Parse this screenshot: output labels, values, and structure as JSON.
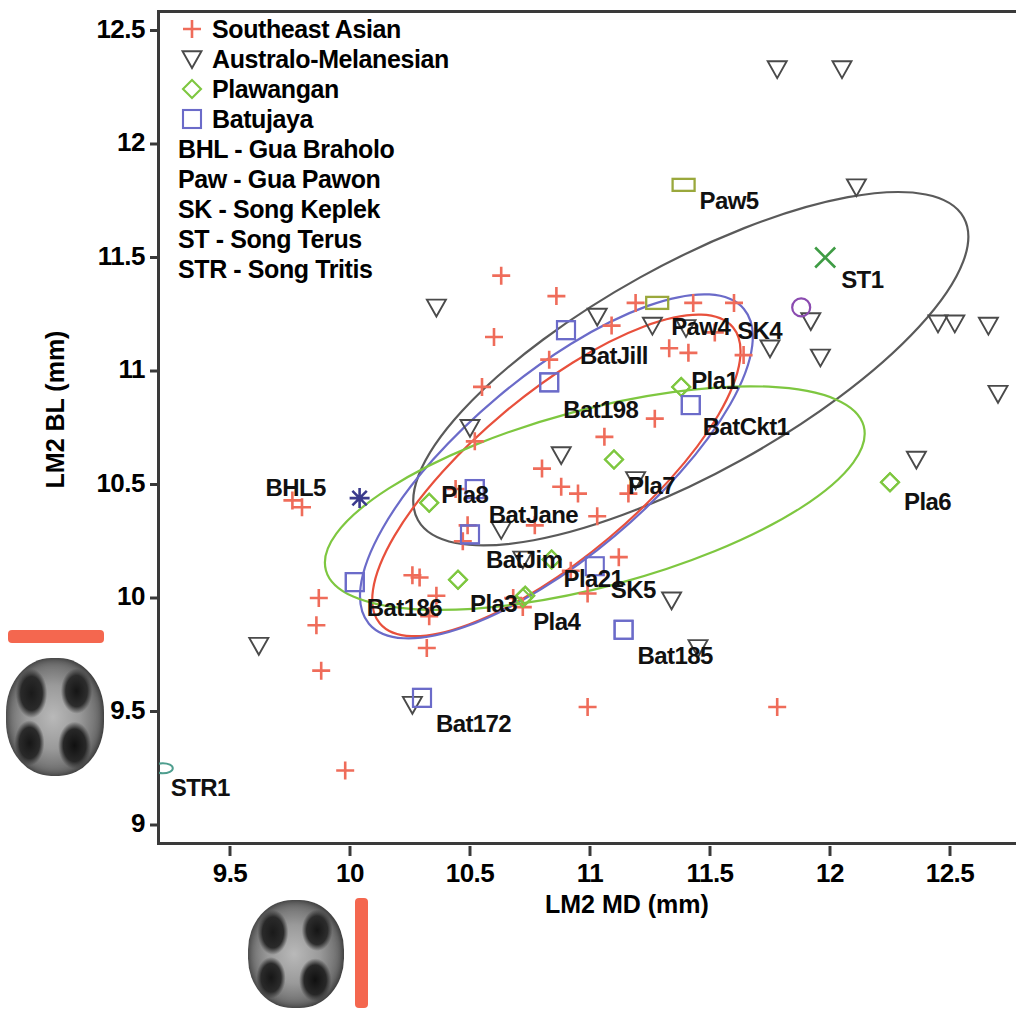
{
  "chart_data": {
    "type": "scatter",
    "title": "",
    "xlabel": "LM2 MD (mm)",
    "ylabel": "LM2  BL (mm)",
    "xlim": [
      9.2,
      12.8
    ],
    "ylim": [
      9.0,
      12.62
    ],
    "xticks": [
      "9.5",
      "10",
      "10.5",
      "11",
      "11.5",
      "12",
      "12.5"
    ],
    "xtick_values": [
      9.5,
      10,
      10.5,
      11,
      11.5,
      12,
      12.5
    ],
    "yticks": [
      "12.5",
      "12",
      "11.5",
      "11",
      "10.5",
      "10",
      "9.5",
      "9"
    ],
    "ytick_values": [
      12.5,
      12,
      11.5,
      11,
      10.5,
      10,
      9.5,
      9
    ],
    "grid": false,
    "legend_position": "top-left",
    "series": [
      {
        "name": "Southeast Asian",
        "marker": "plus",
        "color": "#ef6c5a",
        "points": [
          [
            9.76,
            10.43
          ],
          [
            9.8,
            10.4
          ],
          [
            9.87,
            10.0
          ],
          [
            9.86,
            9.88
          ],
          [
            9.88,
            9.68
          ],
          [
            10.26,
            10.1
          ],
          [
            10.29,
            10.09
          ],
          [
            10.33,
            9.92
          ],
          [
            10.36,
            10.01
          ],
          [
            10.32,
            9.78
          ],
          [
            10.44,
            10.48
          ],
          [
            10.47,
            10.25
          ],
          [
            10.49,
            10.32
          ],
          [
            10.52,
            10.69
          ],
          [
            10.55,
            10.93
          ],
          [
            10.6,
            11.15
          ],
          [
            10.63,
            11.42
          ],
          [
            10.68,
            10.0
          ],
          [
            10.72,
            9.96
          ],
          [
            10.77,
            10.32
          ],
          [
            10.8,
            10.57
          ],
          [
            10.83,
            11.05
          ],
          [
            10.86,
            11.33
          ],
          [
            10.88,
            10.49
          ],
          [
            10.92,
            10.12
          ],
          [
            10.95,
            10.46
          ],
          [
            10.99,
            10.02
          ],
          [
            11.03,
            10.36
          ],
          [
            11.06,
            10.71
          ],
          [
            11.09,
            11.2
          ],
          [
            11.12,
            10.18
          ],
          [
            11.16,
            10.46
          ],
          [
            11.19,
            11.3
          ],
          [
            11.27,
            10.79
          ],
          [
            11.33,
            11.1
          ],
          [
            11.41,
            11.08
          ],
          [
            11.43,
            11.3
          ],
          [
            11.52,
            11.17
          ],
          [
            11.6,
            11.3
          ],
          [
            11.64,
            11.07
          ],
          [
            10.99,
            9.52
          ],
          [
            11.78,
            9.52
          ],
          [
            9.98,
            9.24
          ]
        ]
      },
      {
        "name": "Australo-Melanesian",
        "marker": "triangle-down",
        "color": "#4a4a4a",
        "points": [
          [
            11.78,
            12.33
          ],
          [
            12.05,
            12.33
          ],
          [
            12.11,
            11.81
          ],
          [
            12.45,
            11.21
          ],
          [
            12.52,
            11.21
          ],
          [
            12.66,
            11.2
          ],
          [
            12.7,
            10.9
          ],
          [
            11.92,
            11.22
          ],
          [
            11.75,
            11.1
          ],
          [
            11.96,
            11.06
          ],
          [
            12.36,
            10.61
          ],
          [
            10.36,
            11.28
          ],
          [
            10.5,
            10.75
          ],
          [
            10.88,
            10.63
          ],
          [
            11.26,
            11.2
          ],
          [
            11.4,
            11.19
          ],
          [
            10.63,
            10.3
          ],
          [
            10.72,
            10.17
          ],
          [
            11.34,
            9.99
          ],
          [
            11.45,
            9.78
          ],
          [
            10.26,
            9.53
          ],
          [
            9.62,
            9.79
          ],
          [
            11.03,
            11.24
          ],
          [
            11.19,
            10.52
          ]
        ]
      },
      {
        "name": "Plawangan",
        "marker": "diamond",
        "color": "#7ec740",
        "points": [
          [
            10.33,
            10.42
          ],
          [
            10.45,
            10.08
          ],
          [
            10.73,
            10.01
          ],
          [
            10.84,
            10.17
          ],
          [
            11.1,
            10.61
          ],
          [
            11.38,
            10.93
          ],
          [
            12.25,
            10.51
          ],
          [
            10.72,
            10.0
          ]
        ]
      },
      {
        "name": "Batujaya",
        "marker": "square",
        "color": "#6b6bc9",
        "points": [
          [
            10.9,
            11.18
          ],
          [
            10.83,
            10.95
          ],
          [
            11.42,
            10.85
          ],
          [
            10.52,
            10.48
          ],
          [
            10.5,
            10.28
          ],
          [
            10.02,
            10.07
          ],
          [
            11.14,
            9.86
          ],
          [
            10.3,
            9.56
          ]
        ]
      }
    ],
    "labeled_specimens": [
      {
        "label": "Paw5",
        "x": 11.39,
        "y": 11.82,
        "marker": "rect",
        "color": "#9aa83c",
        "lx": 16,
        "ly": 2
      },
      {
        "label": "ST1",
        "x": 11.98,
        "y": 11.5,
        "marker": "cross",
        "color": "#3f9c45",
        "lx": 16,
        "ly": 8
      },
      {
        "label": "Paw4",
        "x": 11.28,
        "y": 11.3,
        "marker": "rect",
        "color": "#9aa83c",
        "lx": 14,
        "ly": 10
      },
      {
        "label": "SK4",
        "x": 11.88,
        "y": 11.28,
        "marker": "circle",
        "color": "#8b4bb0",
        "lx": -64,
        "ly": 10
      },
      {
        "label": "BatJill",
        "x": 10.9,
        "y": 11.18,
        "marker": "square",
        "color": "#6b6bc9",
        "lx": 14,
        "ly": 12
      },
      {
        "label": "Pla1",
        "x": 11.38,
        "y": 10.93,
        "marker": "diamond",
        "color": "#7ec740",
        "lx": 10,
        "ly": -20
      },
      {
        "label": "Bat198",
        "x": 10.83,
        "y": 10.95,
        "marker": "square",
        "color": "#6b6bc9",
        "lx": 14,
        "ly": 14
      },
      {
        "label": "BatCkt1",
        "x": 11.42,
        "y": 10.85,
        "marker": "square",
        "color": "#6b6bc9",
        "lx": 12,
        "ly": 8
      },
      {
        "label": "Pla7",
        "x": 11.1,
        "y": 10.61,
        "marker": "diamond",
        "color": "#7ec740",
        "lx": 14,
        "ly": 12
      },
      {
        "label": "Pla6",
        "x": 12.25,
        "y": 10.51,
        "marker": "diamond",
        "color": "#7ec740",
        "lx": 14,
        "ly": 6
      },
      {
        "label": "BHL5",
        "x": 10.04,
        "y": 10.44,
        "marker": "asterisk",
        "color": "#3a3a8c",
        "lx": -94,
        "ly": -24
      },
      {
        "label": "Pla8",
        "x": 10.33,
        "y": 10.42,
        "marker": "diamond",
        "color": "#7ec740",
        "lx": 12,
        "ly": -22
      },
      {
        "label": "BatJane",
        "x": 10.52,
        "y": 10.48,
        "marker": "square",
        "color": "#6b6bc9",
        "lx": 14,
        "ly": 12
      },
      {
        "label": "BatJim",
        "x": 10.5,
        "y": 10.28,
        "marker": "square",
        "color": "#6b6bc9",
        "lx": 16,
        "ly": 12
      },
      {
        "label": "Pla21",
        "x": 10.84,
        "y": 10.17,
        "marker": "diamond",
        "color": "#7ec740",
        "lx": 12,
        "ly": 6
      },
      {
        "label": "SK5",
        "x": 11.02,
        "y": 10.14,
        "marker": "square",
        "color": "#6b6bc9",
        "lx": 16,
        "ly": 10
      },
      {
        "label": "Bat186",
        "x": 10.02,
        "y": 10.07,
        "marker": "square",
        "color": "#6b6bc9",
        "lx": 12,
        "ly": 12
      },
      {
        "label": "Pla3",
        "x": 10.45,
        "y": 10.08,
        "marker": "diamond",
        "color": "#7ec740",
        "lx": 12,
        "ly": 10
      },
      {
        "label": "Pla4",
        "x": 10.73,
        "y": 10.01,
        "marker": "diamond",
        "color": "#7ec740",
        "lx": 8,
        "ly": 12
      },
      {
        "label": "Bat185",
        "x": 11.14,
        "y": 9.86,
        "marker": "square",
        "color": "#6b6bc9",
        "lx": 14,
        "ly": 12
      },
      {
        "label": "Bat172",
        "x": 10.3,
        "y": 9.56,
        "marker": "square",
        "color": "#6b6bc9",
        "lx": 14,
        "ly": 12
      },
      {
        "label": "STR1",
        "x": 9.22,
        "y": 9.25,
        "marker": "ellipse",
        "color": "#4e9e8e",
        "lx": 8,
        "ly": 6
      }
    ],
    "confidence_ellipses": [
      {
        "name": "Australo-Melanesian",
        "color": "#5a5a5a",
        "cx": 11.42,
        "cy": 11.01,
        "rx": 1.3,
        "ry": 0.46,
        "rot": -29
      },
      {
        "name": "Southeast Asian",
        "color": "#e8503c",
        "cx": 10.86,
        "cy": 10.54,
        "rx": 0.96,
        "ry": 0.36,
        "rot": -40
      },
      {
        "name": "Batujaya",
        "color": "#6b6bc9",
        "cx": 10.86,
        "cy": 10.58,
        "rx": 1.02,
        "ry": 0.4,
        "rot": -40
      },
      {
        "name": "Plawangan",
        "color": "#7ec740",
        "cx": 11.02,
        "cy": 10.44,
        "rx": 1.16,
        "ry": 0.39,
        "rot": -15
      }
    ],
    "annotations": [
      "BHL - Gua Braholo",
      "Paw - Gua Pawon",
      "SK - Song Keplek",
      "ST - Song Terus",
      "STR - Song Tritis"
    ]
  },
  "legend": {
    "entries": [
      {
        "label": "Southeast Asian",
        "marker": "plus",
        "color": "#ef6c5a"
      },
      {
        "label": "Australo-Melanesian",
        "marker": "triangle-down",
        "color": "#4a4a4a"
      },
      {
        "label": "Plawangan",
        "marker": "diamond",
        "color": "#7ec740"
      },
      {
        "label": "Batujaya",
        "marker": "square",
        "color": "#6b6bc9"
      }
    ],
    "abbreviations": [
      "BHL - Gua Braholo",
      "Paw - Gua Pawon",
      "SK - Song Keplek",
      "ST - Song Terus",
      "STR - Song Tritis"
    ]
  },
  "figure_insets": [
    {
      "name": "occlusal-tooth-photo-left",
      "scalebar_orientation": "horizontal",
      "scalebar_color": "#f4674f"
    },
    {
      "name": "occlusal-tooth-photo-bottom",
      "scalebar_orientation": "vertical",
      "scalebar_color": "#f4674f"
    }
  ]
}
